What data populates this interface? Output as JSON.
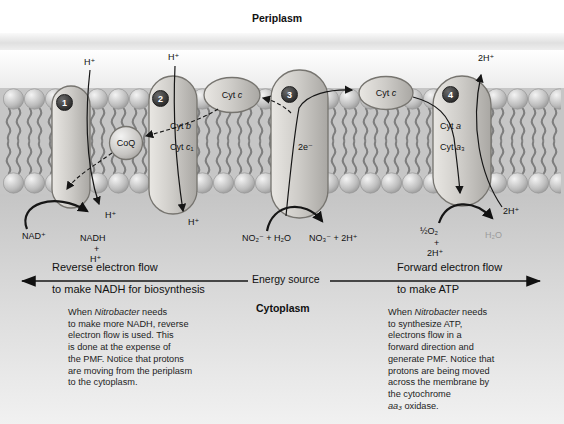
{
  "regions": {
    "periplasm": "Periplasm",
    "cytoplasm": "Cytoplasm"
  },
  "complexes": {
    "badge1": "1",
    "badge2": "2",
    "badge3": "3",
    "badge4": "4",
    "coq": "CoQ",
    "cyt_b": [
      [
        {
          "t": "Cyt "
        },
        {
          "t": "b",
          "i": true
        }
      ]
    ],
    "cyt_c1": [
      [
        {
          "t": "Cyt "
        },
        {
          "t": "c",
          "i": true
        },
        {
          "t": "₁"
        }
      ]
    ],
    "cyt_c_left": [
      [
        {
          "t": "Cyt "
        },
        {
          "t": "c",
          "i": true
        }
      ]
    ],
    "cyt_c_right": [
      [
        {
          "t": "Cyt "
        },
        {
          "t": "c",
          "i": true
        }
      ]
    ],
    "cyt_a": [
      [
        {
          "t": "Cyt "
        },
        {
          "t": "a",
          "i": true
        }
      ]
    ],
    "cyt_a3": [
      [
        {
          "t": "Cyt "
        },
        {
          "t": "a",
          "i": true
        },
        {
          "t": "₃"
        }
      ]
    ],
    "two_electrons": "2e⁻"
  },
  "ions": {
    "h_top1": "H⁺",
    "h_top2": "H⁺",
    "h2_top": "2H⁺",
    "h_bot1": "H⁺",
    "h_bot2": "H⁺",
    "h2_bot": "2H⁺"
  },
  "reactions": {
    "nad": "NAD⁺",
    "nadh": "NADH",
    "plus_left": "+",
    "h_left": "H⁺",
    "no2": "NO₂⁻ + H₂O",
    "no3": "NO₃⁻ + 2H⁺",
    "half_o2": "½O₂",
    "plus_right": "+",
    "h2_right": "2H⁺",
    "h2o": "H₂O"
  },
  "flow": {
    "reverse_line1": "Reverse electron flow",
    "reverse_line2": "to make NADH for biosynthesis",
    "energy_source": "Energy source",
    "forward_line1": "Forward electron flow",
    "forward_line2": "to make ATP"
  },
  "notes": {
    "left": [
      [
        {
          "t": "When "
        },
        {
          "t": "Nitrobacter",
          "i": true
        },
        {
          "t": " needs"
        }
      ],
      [
        {
          "t": "to make more NADH, reverse"
        }
      ],
      [
        {
          "t": "electron flow is used. This"
        }
      ],
      [
        {
          "t": "is done at the expense of"
        }
      ],
      [
        {
          "t": "the PMF. Notice that protons"
        }
      ],
      [
        {
          "t": "are moving from the periplasm"
        }
      ],
      [
        {
          "t": "to the cytoplasm."
        }
      ]
    ],
    "right": [
      [
        {
          "t": "When "
        },
        {
          "t": "Nitrobacter",
          "i": true
        },
        {
          "t": " needs"
        }
      ],
      [
        {
          "t": "to synthesize ATP,"
        }
      ],
      [
        {
          "t": "electrons flow in a"
        }
      ],
      [
        {
          "t": "forward direction and"
        }
      ],
      [
        {
          "t": "generate PMF. Notice that"
        }
      ],
      [
        {
          "t": "protons are being moved"
        }
      ],
      [
        {
          "t": "across the membrane by"
        }
      ],
      [
        {
          "t": "the cytochrome"
        }
      ],
      [
        {
          "t": "aa₃",
          "i": true
        },
        {
          "t": " oxidase."
        }
      ]
    ]
  },
  "colors": {
    "accent_dark": "#2c2c2c",
    "membrane_gray": "#c6c6c6",
    "faded_label": "#9b9b9b"
  }
}
